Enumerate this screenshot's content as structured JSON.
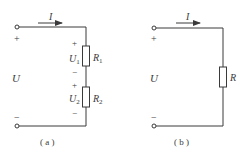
{
  "circuit_a": {
    "caption": "( a )",
    "current_label": "I",
    "source_voltage": "U",
    "plus_sign": "+",
    "minus_sign": "−",
    "resistors": [
      {
        "name": "R",
        "sub": "1",
        "voltage": "U",
        "voltage_sub": "1"
      },
      {
        "name": "R",
        "sub": "2",
        "voltage": "U",
        "voltage_sub": "2"
      }
    ]
  },
  "circuit_b": {
    "caption": "( b )",
    "current_label": "I",
    "source_voltage": "U",
    "plus_sign": "+",
    "minus_sign": "−",
    "resistor": {
      "name": "R"
    }
  }
}
